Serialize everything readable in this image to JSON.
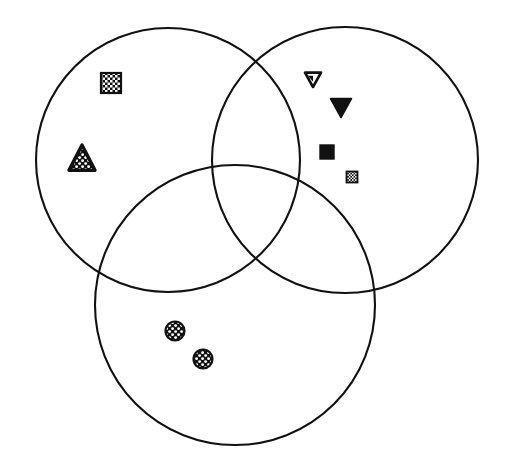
{
  "figure": {
    "width": 507,
    "height": 464,
    "background_color": "#ffffff",
    "stroke_color": "#111111"
  },
  "chart_data": {
    "type": "diagram",
    "subtype": "venn-3-set",
    "xlabel": "",
    "ylabel": "",
    "grid": false,
    "legend": "none",
    "xlim": [
      0,
      507
    ],
    "ylim": [
      0,
      464
    ],
    "sets": [
      {
        "id": "set-left",
        "name": "left-set",
        "label": "",
        "center_x": 168,
        "center_y": 160,
        "radius": 132,
        "stroke": "#111111",
        "stroke_width": 2.1,
        "fill": "none",
        "member_count": 2
      },
      {
        "id": "set-right",
        "name": "right-set",
        "label": "",
        "center_x": 345,
        "center_y": 160,
        "radius": 133,
        "stroke": "#111111",
        "stroke_width": 2.1,
        "fill": "none",
        "member_count": 4
      },
      {
        "id": "set-bottom",
        "name": "bottom-set",
        "label": "",
        "center_x": 235,
        "center_y": 305,
        "radius": 140,
        "stroke": "#111111",
        "stroke_width": 2.1,
        "fill": "none",
        "member_count": 2
      }
    ],
    "regions": [
      {
        "id": "left-only",
        "sets": [
          "set-left"
        ],
        "marker_count": 2
      },
      {
        "id": "right-only",
        "sets": [
          "set-right"
        ],
        "marker_count": 4
      },
      {
        "id": "bottom-only",
        "sets": [
          "set-bottom"
        ],
        "marker_count": 2
      },
      {
        "id": "left-right",
        "sets": [
          "set-left",
          "set-right"
        ],
        "marker_count": 0
      },
      {
        "id": "left-bottom",
        "sets": [
          "set-left",
          "set-bottom"
        ],
        "marker_count": 0
      },
      {
        "id": "right-bottom",
        "sets": [
          "set-right",
          "set-bottom"
        ],
        "marker_count": 0
      },
      {
        "id": "all-three",
        "sets": [
          "set-left",
          "set-right",
          "set-bottom"
        ],
        "marker_count": 0
      }
    ],
    "markers": [
      {
        "id": "marker-1",
        "icon": "checkered-square-icon",
        "shape": "square",
        "fill_style": "checker",
        "region": "left-only",
        "x": 111,
        "y": 83,
        "size": 20,
        "stroke": "#111111",
        "fill": "#111111",
        "pattern_color": "#ffffff"
      },
      {
        "id": "marker-2",
        "icon": "speckled-triangle-icon",
        "shape": "triangle-up",
        "fill_style": "speckle",
        "region": "left-only",
        "x": 82,
        "y": 158,
        "size": 26,
        "stroke": "#111111",
        "fill": "#111111",
        "pattern_color": "#ffffff"
      },
      {
        "id": "marker-3",
        "icon": "outlined-down-triangle-icon",
        "shape": "triangle-down",
        "fill_style": "outline",
        "region": "right-only",
        "x": 313,
        "y": 79,
        "size": 16,
        "stroke": "#111111",
        "fill": "#ffffff",
        "pattern_color": "#111111"
      },
      {
        "id": "marker-4",
        "icon": "solid-down-triangle-icon",
        "shape": "triangle-down",
        "fill_style": "solid",
        "region": "right-only",
        "x": 341,
        "y": 107,
        "size": 21,
        "stroke": "#111111",
        "fill": "#111111",
        "pattern_color": "#111111"
      },
      {
        "id": "marker-5",
        "icon": "solid-square-icon",
        "shape": "square",
        "fill_style": "solid",
        "region": "right-only",
        "x": 327,
        "y": 152,
        "size": 14,
        "stroke": "#111111",
        "fill": "#111111",
        "pattern_color": "#111111"
      },
      {
        "id": "marker-6",
        "icon": "small-checkered-square-icon",
        "shape": "square",
        "fill_style": "checker",
        "region": "right-only",
        "x": 352,
        "y": 177,
        "size": 11,
        "stroke": "#111111",
        "fill": "#111111",
        "pattern_color": "#ffffff"
      },
      {
        "id": "marker-7",
        "icon": "speckled-circle-icon",
        "shape": "circle",
        "fill_style": "speckle",
        "region": "bottom-only",
        "x": 175,
        "y": 331,
        "size": 19,
        "stroke": "#111111",
        "fill": "#111111",
        "pattern_color": "#ffffff"
      },
      {
        "id": "marker-8",
        "icon": "speckled-circle-icon",
        "shape": "circle",
        "fill_style": "speckle",
        "region": "bottom-only",
        "x": 203,
        "y": 359,
        "size": 19,
        "stroke": "#111111",
        "fill": "#111111",
        "pattern_color": "#ffffff"
      }
    ]
  }
}
